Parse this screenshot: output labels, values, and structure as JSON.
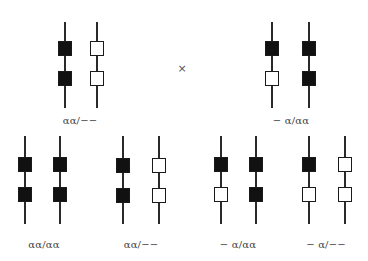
{
  "diagram": {
    "cross_symbol": "×",
    "colors": {
      "filled": "#111111",
      "empty": "#ffffff",
      "line": "#2a2a2a"
    },
    "parents": [
      {
        "label": "αα/−−",
        "chromosomes": [
          {
            "loci": [
              "filled",
              "filled"
            ]
          },
          {
            "loci": [
              "empty",
              "empty"
            ]
          }
        ]
      },
      {
        "label": "− α/αα",
        "chromosomes": [
          {
            "loci": [
              "filled",
              "empty"
            ]
          },
          {
            "loci": [
              "filled",
              "filled"
            ]
          }
        ]
      }
    ],
    "offspring": [
      {
        "label": "αα/αα",
        "chromosomes": [
          {
            "loci": [
              "filled",
              "filled"
            ]
          },
          {
            "loci": [
              "filled",
              "filled"
            ]
          }
        ]
      },
      {
        "label": "αα/−−",
        "chromosomes": [
          {
            "loci": [
              "filled",
              "filled"
            ]
          },
          {
            "loci": [
              "empty",
              "empty"
            ]
          }
        ]
      },
      {
        "label": "− α/αα",
        "chromosomes": [
          {
            "loci": [
              "filled",
              "empty"
            ]
          },
          {
            "loci": [
              "filled",
              "filled"
            ]
          }
        ]
      },
      {
        "label": "− α/−−",
        "chromosomes": [
          {
            "loci": [
              "filled",
              "empty"
            ]
          },
          {
            "loci": [
              "empty",
              "empty"
            ]
          }
        ]
      }
    ]
  }
}
